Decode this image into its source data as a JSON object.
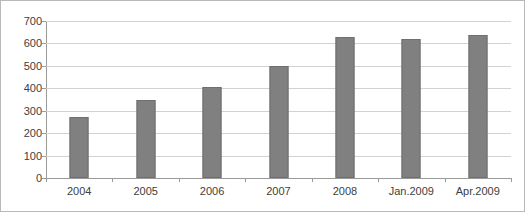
{
  "chart_data": {
    "type": "bar",
    "title": "",
    "subtitle": "",
    "xlabel": "",
    "ylabel": "",
    "categories": [
      "2004",
      "2005",
      "2006",
      "2007",
      "2008",
      "Jan.2009",
      "Apr.2009"
    ],
    "values": [
      270,
      350,
      405,
      500,
      628,
      618,
      638
    ],
    "series": [
      {
        "name": "",
        "values": [
          270,
          350,
          405,
          500,
          628,
          618,
          638
        ]
      }
    ],
    "ylim": [
      0,
      700
    ],
    "y_ticks": [
      0,
      100,
      200,
      300,
      400,
      500,
      600,
      700
    ],
    "y_tick_labels": [
      "0",
      "100",
      "200",
      "300",
      "400",
      "500",
      "600",
      "700"
    ],
    "grid": true,
    "grid_axis": "y",
    "legend": false,
    "legend_position": "none",
    "bar_color": "#808080",
    "bar_border_color": "#6f6f6f",
    "gridline_color": "#d2d2d2",
    "axis_color": "#9a9a9a",
    "text_color": "#404040",
    "background_color": "#ffffff",
    "frame_border_color": "#b9b9b9"
  }
}
